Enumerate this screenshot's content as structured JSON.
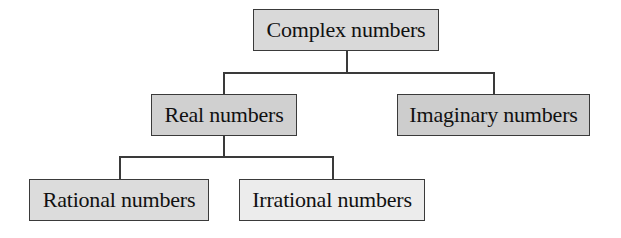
{
  "diagram": {
    "nodes": {
      "complex": {
        "label": "Complex numbers",
        "fill": "#d9d9d9"
      },
      "real": {
        "label": "Real numbers",
        "fill": "#d0d0d0"
      },
      "imaginary": {
        "label": "Imaginary numbers",
        "fill": "#cdcdcd"
      },
      "rational": {
        "label": "Rational numbers",
        "fill": "#dcdcdc"
      },
      "irrational": {
        "label": "Irrational numbers",
        "fill": "#ececec"
      }
    },
    "edges": [
      {
        "from": "Complex numbers",
        "to": "Real numbers"
      },
      {
        "from": "Complex numbers",
        "to": "Imaginary numbers"
      },
      {
        "from": "Real numbers",
        "to": "Rational numbers"
      },
      {
        "from": "Real numbers",
        "to": "Irrational numbers"
      }
    ],
    "line_color": "#3a3a3a"
  }
}
